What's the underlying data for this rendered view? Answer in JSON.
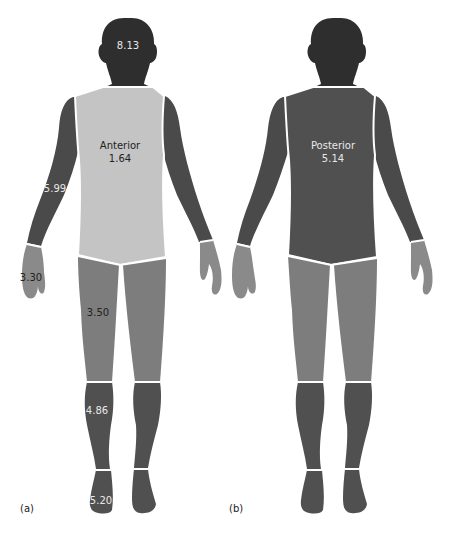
{
  "figure": {
    "panels": [
      {
        "id": "a",
        "panel_label": "(a)",
        "view": "Anterior",
        "labels": {
          "head": "8.13",
          "torso_title": "Anterior",
          "torso_value": "1.64",
          "upper_arm": "5.99",
          "hand": "3.30",
          "thigh": "3.50",
          "calf": "4.86",
          "foot": "5.20"
        }
      },
      {
        "id": "b",
        "panel_label": "(b)",
        "view": "Posterior",
        "labels": {
          "torso_title": "Posterior",
          "torso_value": "5.14"
        }
      }
    ],
    "colors": {
      "head": "#2e2e2e",
      "arm_dark": "#4a4a4a",
      "torso_anterior": "#c4c4c4",
      "torso_posterior": "#505050",
      "hand": "#8a8a8a",
      "thigh": "#7d7d7d",
      "calf": "#505050",
      "foot": "#505050",
      "divider": "#ffffff"
    }
  }
}
